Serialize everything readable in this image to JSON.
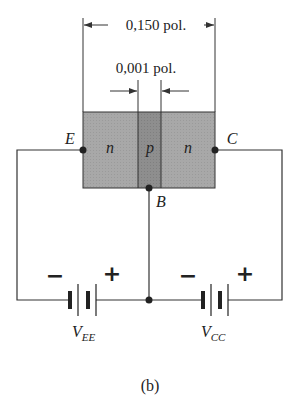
{
  "figure": {
    "caption": "(b)",
    "dimensions": {
      "total_width_label": "0,150 pol.",
      "base_width_label": "0,001 pol."
    },
    "regions": [
      {
        "id": "emitter",
        "label": "n"
      },
      {
        "id": "base",
        "label": "p"
      },
      {
        "id": "collector",
        "label": "n"
      }
    ],
    "terminals": {
      "emitter": "E",
      "base": "B",
      "collector": "C"
    },
    "sources": [
      {
        "id": "vee",
        "name": "V",
        "subscript": "EE",
        "neg": "−",
        "pos": "+"
      },
      {
        "id": "vcc",
        "name": "V",
        "subscript": "CC",
        "neg": "−",
        "pos": "+"
      }
    ],
    "colors": {
      "n_region": "#a6a6a6",
      "p_region": "#8c8c8c",
      "wire": "#333333"
    }
  }
}
